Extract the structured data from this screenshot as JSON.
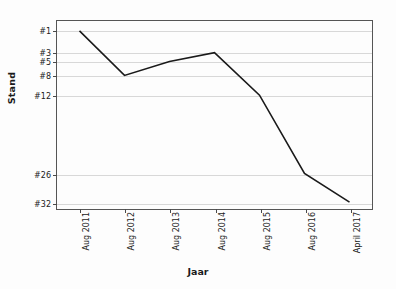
{
  "chart_data": {
    "type": "line",
    "title": "",
    "xlabel": "Jaar",
    "ylabel": "Stand",
    "grid": true,
    "legend": "none",
    "inverted_y": true,
    "categories": [
      "Aug 2011",
      "Aug 2012",
      "Aug 2013",
      "Aug 2014",
      "Aug 2015",
      "Aug 2016",
      "April 2017"
    ],
    "ytick_labels": [
      "#1",
      "#3",
      "#5",
      "#8",
      "#12",
      "#26",
      "#32"
    ],
    "ytick_values": [
      1,
      3,
      5,
      8,
      12,
      26,
      32
    ],
    "ylim": [
      1,
      32
    ],
    "series": [
      {
        "name": "Stand",
        "values": [
          1,
          8,
          5,
          3,
          12,
          26,
          32
        ]
      }
    ],
    "points": [
      {
        "x": "Aug 2011",
        "y": 1,
        "label": "#1"
      },
      {
        "x": "Aug 2012",
        "y": 8,
        "label": "#8"
      },
      {
        "x": "Aug 2013",
        "y": 5,
        "label": "#5"
      },
      {
        "x": "Aug 2014",
        "y": 3,
        "label": "#3"
      },
      {
        "x": "Aug 2015",
        "y": 12,
        "label": "#12"
      },
      {
        "x": "Aug 2016",
        "y": 26,
        "label": "#26"
      },
      {
        "x": "April 2017",
        "y": 32,
        "label": "#32"
      }
    ],
    "colors": {
      "line": "#1a1a1a",
      "grid": "#d8d8d8",
      "axis": "#555555",
      "background": "#fdfdfd",
      "text": "#1b1b1b"
    }
  }
}
